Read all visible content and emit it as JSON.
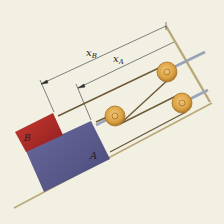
{
  "diagram": {
    "type": "pulley-system-on-incline",
    "labels": {
      "block_a": "A",
      "block_b": "B",
      "dim_b": "x",
      "dim_b_sub": "B",
      "dim_a": "x",
      "dim_a_sub": "A"
    },
    "colors": {
      "background": "#f2f0e2",
      "block_a": "#5a5a8c",
      "block_b": "#b4282a",
      "pulley": "#d9a040",
      "cable": "#6b5a3a",
      "incline": "#c8b888"
    },
    "pulley_count": 3
  }
}
